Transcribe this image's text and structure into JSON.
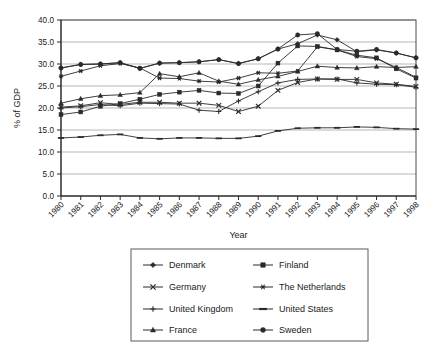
{
  "chart_data": {
    "type": "line",
    "title": "",
    "xlabel": "Year",
    "ylabel": "% of GDP",
    "x": [
      1980,
      1981,
      1982,
      1983,
      1984,
      1985,
      1986,
      1987,
      1988,
      1989,
      1990,
      1991,
      1992,
      1993,
      1994,
      1995,
      1996,
      1997,
      1998
    ],
    "xtick_labels": [
      "1980",
      "1981",
      "1982",
      "1983",
      "1984",
      "1985",
      "1986",
      "1987",
      "1988",
      "1989",
      "1990",
      "1991",
      "1992",
      "1993",
      "1994",
      "1995",
      "1996",
      "1997",
      "1998"
    ],
    "ytick_labels": [
      "0.0",
      "5.0",
      "10.0",
      "15.0",
      "20.0",
      "25.0",
      "30.0",
      "35.0",
      "40.0"
    ],
    "yticks": [
      0,
      5,
      10,
      15,
      20,
      25,
      30,
      35,
      40
    ],
    "ylim": [
      0,
      40
    ],
    "xlim": [
      1980,
      1998
    ],
    "grid": "horizontal",
    "legend_position": "bottom",
    "legend_columns": 2,
    "series": [
      {
        "name": "Denmark",
        "marker": "diamond",
        "values": [
          29.1,
          29.9,
          30.0,
          30.3,
          29.0,
          30.2,
          30.3,
          30.5,
          31.0,
          30.1,
          31.2,
          33.4,
          34.6,
          36.6,
          35.5,
          32.8,
          33.2,
          32.5,
          31.4
        ]
      },
      {
        "name": "Finland",
        "marker": "square",
        "values": [
          18.5,
          19.1,
          20.4,
          21.0,
          22.0,
          23.1,
          23.6,
          24.0,
          23.4,
          23.3,
          25.0,
          30.2,
          34.1,
          34.0,
          33.2,
          32.0,
          31.4,
          28.9,
          26.8
        ]
      },
      {
        "name": "Germany",
        "marker": "cross",
        "values": [
          20.2,
          20.5,
          21.2,
          20.8,
          21.3,
          21.3,
          21.1,
          21.1,
          20.6,
          19.2,
          20.4,
          24.0,
          25.8,
          26.6,
          26.5,
          26.5,
          25.7,
          25.4,
          24.9
        ]
      },
      {
        "name": "The Netherlands",
        "marker": "asterisk",
        "values": [
          27.2,
          28.4,
          29.6,
          30.1,
          29.1,
          26.8,
          26.7,
          26.1,
          25.9,
          26.8,
          28.0,
          27.9,
          28.4,
          33.9,
          33.2,
          31.7,
          31.2,
          29.2,
          27.0
        ]
      },
      {
        "name": "United Kingdom",
        "marker": "plus",
        "values": [
          20.0,
          20.3,
          20.8,
          20.5,
          21.1,
          21.0,
          20.9,
          19.5,
          19.2,
          21.6,
          23.7,
          25.7,
          26.5,
          26.6,
          26.6,
          25.7,
          25.4,
          25.3,
          24.7
        ]
      },
      {
        "name": "United States",
        "marker": "dash",
        "values": [
          13.2,
          13.4,
          13.8,
          14.0,
          13.2,
          13.0,
          13.2,
          13.2,
          13.1,
          13.1,
          13.6,
          14.8,
          15.4,
          15.5,
          15.5,
          15.7,
          15.6,
          15.3,
          15.2
        ]
      },
      {
        "name": "France",
        "marker": "triangle",
        "values": [
          21.1,
          22.1,
          22.8,
          23.0,
          23.5,
          27.8,
          27.1,
          28.0,
          26.1,
          25.4,
          26.4,
          27.2,
          28.3,
          29.5,
          29.2,
          29.1,
          29.4,
          29.2,
          29.4
        ]
      },
      {
        "name": "Sweden",
        "marker": "circle",
        "values": [
          29.1,
          29.9,
          30.0,
          30.3,
          29.0,
          30.2,
          30.3,
          30.5,
          31.0,
          30.1,
          31.2,
          33.4,
          36.6,
          36.9,
          33.3,
          32.9,
          33.3,
          32.5,
          31.4
        ]
      }
    ],
    "legend_entries": [
      {
        "label": "Denmark",
        "marker": "diamond"
      },
      {
        "label": "Finland",
        "marker": "square"
      },
      {
        "label": "Germany",
        "marker": "cross"
      },
      {
        "label": "The Netherlands",
        "marker": "asterisk"
      },
      {
        "label": "United Kingdom",
        "marker": "plus"
      },
      {
        "label": "United States",
        "marker": "dash"
      },
      {
        "label": "France",
        "marker": "triangle"
      },
      {
        "label": "Sweden",
        "marker": "circle"
      }
    ],
    "colors": {
      "ink": "#2a2a2a",
      "grid": "#9a9a9a",
      "frame": "#5a5a5a",
      "background": "#ffffff"
    }
  }
}
